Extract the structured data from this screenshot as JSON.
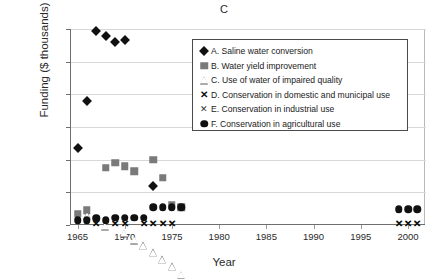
{
  "chart_data": {
    "type": "scatter",
    "title": "C",
    "xlabel": "Year",
    "ylabel": "Funding ($ thousands)",
    "xlim": [
      1964.2,
      2001.8
    ],
    "ylim": [
      0,
      120000
    ],
    "xticks": [
      "1965",
      "1970",
      "1975",
      "1980",
      "1985",
      "1990",
      "1995",
      "2000"
    ],
    "xtick_values": [
      1965,
      1970,
      1975,
      1980,
      1985,
      1990,
      1995,
      2000
    ],
    "yticks": [
      "0",
      "20,000",
      "40,000",
      "60,000",
      "80,000",
      "100,000",
      "120,000"
    ],
    "ytick_values": [
      0,
      20000,
      40000,
      60000,
      80000,
      100000,
      120000
    ],
    "grid": "horizontal",
    "legend_position": "upper-center-right",
    "series": [
      {
        "name": "A. Saline water conversion",
        "key": "A",
        "marker": "filled-diamond",
        "color": "#111111",
        "points": [
          [
            1965,
            47000
          ],
          [
            1966,
            76000
          ],
          [
            1967,
            119000
          ],
          [
            1968,
            116000
          ],
          [
            1969,
            112000
          ],
          [
            1970,
            113000
          ],
          [
            1973,
            24000
          ]
        ]
      },
      {
        "name": "B. Water yield improvement",
        "key": "B",
        "marker": "filled-square",
        "color": "#7a7a7a",
        "points": [
          [
            1965,
            7000
          ],
          [
            1966,
            9000
          ],
          [
            1968,
            35000
          ],
          [
            1969,
            38000
          ],
          [
            1970,
            36000
          ],
          [
            1971,
            33000
          ],
          [
            1973,
            40000
          ],
          [
            1974,
            29000
          ],
          [
            1975,
            12000
          ],
          [
            1976,
            11000
          ]
        ]
      },
      {
        "name": "C. Use of water of impaired quality",
        "key": "C",
        "marker": "open-triangle",
        "color": "#555555",
        "points": [
          [
            1966,
            5500
          ],
          [
            1968,
            3500
          ],
          [
            1970,
            3500
          ],
          [
            1971,
            3500
          ],
          [
            1972,
            4500
          ],
          [
            1973,
            4500
          ],
          [
            1974,
            4500
          ],
          [
            1975,
            4500
          ],
          [
            1976,
            3500
          ],
          [
            1999,
            3000
          ],
          [
            2000,
            3000
          ],
          [
            2001,
            3000
          ]
        ]
      },
      {
        "name": "D. Conservation in domestic and municipal use",
        "key": "D",
        "marker": "x-bold",
        "color": "#111111",
        "points": [
          [
            1967,
            500
          ],
          [
            1969,
            500
          ],
          [
            1970,
            500
          ],
          [
            1972,
            500
          ],
          [
            1973,
            500
          ],
          [
            1974,
            500
          ],
          [
            1975,
            500
          ],
          [
            1999,
            500
          ],
          [
            2000,
            500
          ],
          [
            2001,
            500
          ]
        ]
      },
      {
        "name": "E. Conservation in industrial use",
        "key": "E",
        "marker": "x-thin",
        "color": "#333333",
        "points": [
          [
            1967,
            800
          ],
          [
            1969,
            800
          ],
          [
            1970,
            800
          ],
          [
            1972,
            800
          ],
          [
            1973,
            800
          ],
          [
            1974,
            800
          ],
          [
            1975,
            800
          ],
          [
            1999,
            800
          ],
          [
            2000,
            800
          ],
          [
            2001,
            800
          ]
        ]
      },
      {
        "name": "F. Conservation in agricultural use",
        "key": "F",
        "marker": "filled-circle",
        "color": "#111111",
        "points": [
          [
            1965,
            3000
          ],
          [
            1966,
            3000
          ],
          [
            1967,
            4000
          ],
          [
            1968,
            3000
          ],
          [
            1969,
            4500
          ],
          [
            1970,
            4500
          ],
          [
            1971,
            4500
          ],
          [
            1972,
            4500
          ],
          [
            1973,
            11000
          ],
          [
            1974,
            11000
          ],
          [
            1975,
            11000
          ],
          [
            1976,
            11000
          ],
          [
            1999,
            9500
          ],
          [
            2000,
            9500
          ],
          [
            2001,
            9500
          ]
        ]
      }
    ]
  },
  "legend": {
    "items": [
      {
        "marker": "filled-diamond",
        "label": "A. Saline water conversion"
      },
      {
        "marker": "filled-square",
        "label": "B. Water yield improvement"
      },
      {
        "marker": "open-triangle",
        "label": "C. Use of water of impaired quality"
      },
      {
        "marker": "x-bold",
        "label": "D. Conservation in domestic and municipal use"
      },
      {
        "marker": "x-thin",
        "label": "E. Conservation in industrial use"
      },
      {
        "marker": "filled-circle",
        "label": "F. Conservation in agricultural use"
      }
    ]
  }
}
